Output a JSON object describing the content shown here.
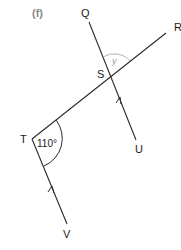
{
  "diagram": {
    "part_label": "(f)",
    "points": {
      "Q": "Q",
      "R": "R",
      "S": "S",
      "T": "T",
      "U": "U",
      "V": "V"
    },
    "angles": {
      "at_T": "110°",
      "at_S": "y"
    },
    "colors": {
      "line": "#2a2a2a",
      "arc": "#9a9a9a",
      "part_label": "#8a8a8a"
    },
    "parallel_markers": [
      "arrow on SU (pointing toward S)",
      "arrow on TV (pointing toward T)"
    ]
  }
}
